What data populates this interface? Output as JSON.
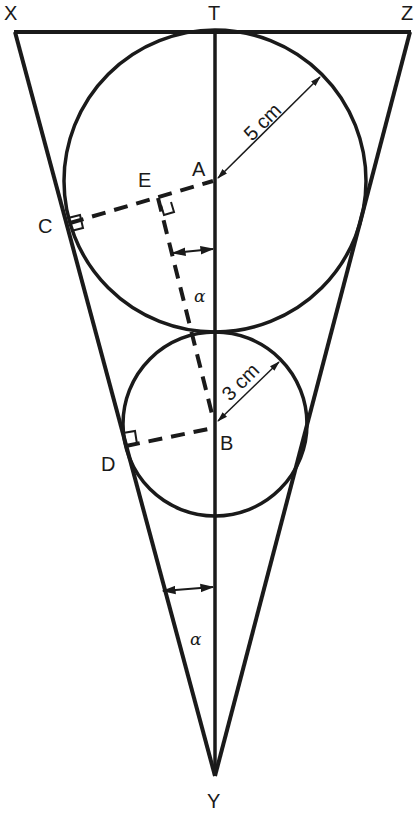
{
  "diagram": {
    "points": {
      "X": "X",
      "T": "T",
      "Z": "Z",
      "A": "A",
      "B": "B",
      "C": "C",
      "D": "D",
      "E": "E",
      "Y": "Y"
    },
    "dimensions": {
      "large_radius": "5 cm",
      "small_radius": "3 cm"
    },
    "angles": {
      "upper": "α",
      "lower": "α"
    },
    "colors": {
      "stroke": "#1a1a1a",
      "background": "#ffffff"
    }
  }
}
